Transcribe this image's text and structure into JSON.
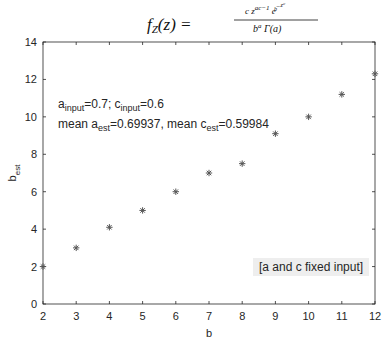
{
  "title": {
    "lhs": "f",
    "lhs_sub": "Z",
    "lhs_arg": "(z) =",
    "numerator": "c z^(ac-1) e^(-z^c/b)",
    "denominator": "b^a Γ(a)"
  },
  "annotations": {
    "line1": {
      "a_label": "a",
      "a_sub": "input",
      "a_val": "=0.7; ",
      "c_label": "c",
      "c_sub": "input",
      "c_val": "=0.6"
    },
    "line2": {
      "a_label": "mean a",
      "a_sub": "est",
      "a_val": "=0.69937, ",
      "c_label": "mean c",
      "c_sub": "est",
      "c_val": "=0.59984"
    },
    "box": "[a and c fixed input]"
  },
  "chart_data": {
    "type": "scatter",
    "xlabel": "b",
    "ylabel": "b_est",
    "xlim": [
      2,
      12
    ],
    "ylim": [
      0,
      14
    ],
    "xticks": [
      2,
      3,
      4,
      5,
      6,
      7,
      8,
      9,
      10,
      11,
      12
    ],
    "yticks": [
      0,
      2,
      4,
      6,
      8,
      10,
      12,
      14
    ],
    "grid": false,
    "marker": "*",
    "series": [
      {
        "name": "b_est",
        "x": [
          2,
          3,
          4,
          5,
          6,
          7,
          8,
          9,
          10,
          11,
          12
        ],
        "y": [
          2.0,
          3.0,
          4.1,
          5.0,
          6.0,
          7.0,
          7.5,
          9.1,
          10.0,
          11.2,
          12.3
        ]
      }
    ],
    "annotations": [
      "a_input=0.7; c_input=0.6",
      "mean a_est=0.69937, mean c_est=0.59984",
      "[a and c fixed input]"
    ]
  }
}
